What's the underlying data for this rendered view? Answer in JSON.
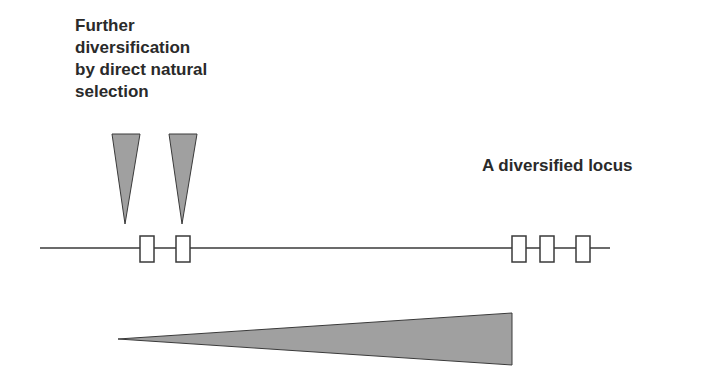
{
  "annotations": {
    "left_label_lines": [
      "Further",
      "diversification",
      "by direct natural",
      "selection"
    ],
    "right_label": "A diversified locus"
  },
  "diagram": {
    "locus_line": {
      "x1": 40,
      "x2": 610,
      "y": 248
    },
    "exon_boxes": [
      {
        "name": "exon-1",
        "x": 140,
        "y": 236,
        "w": 14,
        "h": 26
      },
      {
        "name": "exon-2",
        "x": 176,
        "y": 236,
        "w": 14,
        "h": 26
      },
      {
        "name": "exon-3",
        "x": 512,
        "y": 236,
        "w": 14,
        "h": 26
      },
      {
        "name": "exon-4",
        "x": 540,
        "y": 236,
        "w": 14,
        "h": 26
      },
      {
        "name": "exon-5",
        "x": 576,
        "y": 236,
        "w": 14,
        "h": 26
      }
    ],
    "selection_wedges": [
      {
        "name": "wedge-1",
        "x_left": 112,
        "x_right": 140,
        "y_top": 134,
        "tip_x": 125,
        "tip_y": 224
      },
      {
        "name": "wedge-2",
        "x_left": 169,
        "x_right": 197,
        "y_top": 134,
        "tip_x": 182,
        "tip_y": 224
      }
    ],
    "diversity_gradient": {
      "tip_x": 118,
      "tip_y": 339,
      "base_x": 512,
      "base_top": 313,
      "base_bottom": 365
    },
    "colors": {
      "fill": "#a0a0a0",
      "stroke": "#3a3a3a",
      "box_fill": "#ffffff"
    }
  }
}
